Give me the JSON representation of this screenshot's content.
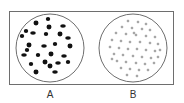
{
  "diagram": {
    "panels": [
      {
        "label": "A",
        "description": "circle with larger, sparse dark irregular particles",
        "circle": {
          "cx": 50,
          "cy": 48,
          "r": 34
        },
        "particle_style": "large-dark-blob",
        "particle_color": "#111111",
        "particles": [
          [
            48,
            19
          ],
          [
            36,
            23
          ],
          [
            63,
            26
          ],
          [
            26,
            31
          ],
          [
            49,
            27
          ],
          [
            33,
            33
          ],
          [
            46,
            34
          ],
          [
            60,
            34
          ],
          [
            68,
            38
          ],
          [
            22,
            36
          ],
          [
            29,
            45
          ],
          [
            44,
            46
          ],
          [
            55,
            44
          ],
          [
            70,
            46
          ],
          [
            24,
            55
          ],
          [
            38,
            55
          ],
          [
            51,
            54
          ],
          [
            64,
            56
          ],
          [
            31,
            64
          ],
          [
            45,
            62
          ],
          [
            58,
            63
          ],
          [
            68,
            62
          ],
          [
            36,
            72
          ],
          [
            55,
            72
          ],
          [
            27,
            50
          ],
          [
            50,
            66
          ]
        ]
      },
      {
        "label": "B",
        "description": "circle with many small, evenly dispersed hollow particles",
        "circle": {
          "cx": 133,
          "cy": 48,
          "r": 34
        },
        "particle_style": "small-ring",
        "particle_color": "#555555",
        "particles": [
          [
            128,
            21
          ],
          [
            138,
            22
          ],
          [
            146,
            24
          ],
          [
            122,
            27
          ],
          [
            132,
            28
          ],
          [
            142,
            29
          ],
          [
            150,
            30
          ],
          [
            116,
            33
          ],
          [
            126,
            34
          ],
          [
            136,
            35
          ],
          [
            146,
            36
          ],
          [
            155,
            37
          ],
          [
            112,
            40
          ],
          [
            121,
            41
          ],
          [
            130,
            42
          ],
          [
            140,
            42
          ],
          [
            150,
            43
          ],
          [
            158,
            44
          ],
          [
            110,
            47
          ],
          [
            119,
            48
          ],
          [
            128,
            49
          ],
          [
            137,
            49
          ],
          [
            146,
            50
          ],
          [
            155,
            51
          ],
          [
            114,
            54
          ],
          [
            123,
            55
          ],
          [
            133,
            56
          ],
          [
            142,
            57
          ],
          [
            151,
            58
          ],
          [
            158,
            57
          ],
          [
            117,
            61
          ],
          [
            126,
            62
          ],
          [
            136,
            63
          ],
          [
            145,
            64
          ],
          [
            154,
            63
          ],
          [
            121,
            68
          ],
          [
            130,
            69
          ],
          [
            139,
            70
          ],
          [
            148,
            70
          ],
          [
            127,
            75
          ],
          [
            137,
            76
          ],
          [
            112,
            59
          ],
          [
            160,
            50
          ],
          [
            134,
            33
          ]
        ]
      }
    ],
    "frame": {
      "x": 9,
      "y": 11,
      "width": 165,
      "height": 74,
      "stroke": "#6e6e6e"
    },
    "circle_stroke": "#6e6e6e"
  }
}
